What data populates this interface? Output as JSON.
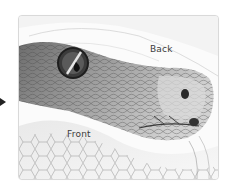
{
  "figure": {
    "labels": {
      "back": "Back",
      "front": "Front"
    },
    "colors": {
      "card_border": "#d9d9d9",
      "card_background": "#fbfbfb",
      "label_text": "#3a3a3a",
      "scale_dark": "#5a5a5a",
      "scale_mid": "#9a9a9a",
      "scale_light": "#cfcfcf",
      "eye_dark": "#1e1e1e"
    }
  }
}
